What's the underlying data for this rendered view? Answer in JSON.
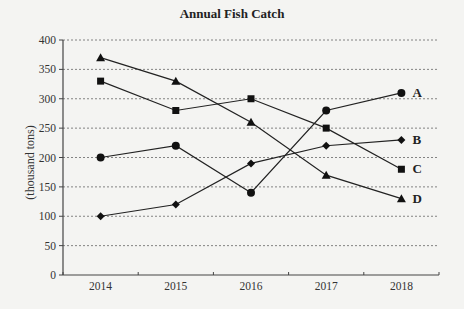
{
  "chart_data": {
    "type": "line",
    "title": "Annual Fish Catch",
    "xlabel": "",
    "ylabel": "(thousand tons)",
    "categories": [
      "2014",
      "2015",
      "2016",
      "2017",
      "2018"
    ],
    "ylim": [
      0,
      400
    ],
    "yticks": [
      0,
      50,
      100,
      150,
      200,
      250,
      300,
      350,
      400
    ],
    "grid": "horizontal dotted",
    "legend": "direct labels at right end of each line",
    "series": [
      {
        "name": "A",
        "marker": "circle",
        "values": [
          200,
          220,
          140,
          280,
          310
        ]
      },
      {
        "name": "B",
        "marker": "diamond",
        "values": [
          100,
          120,
          190,
          220,
          230
        ]
      },
      {
        "name": "C",
        "marker": "square",
        "values": [
          330,
          280,
          300,
          250,
          180
        ]
      },
      {
        "name": "D",
        "marker": "triangle",
        "values": [
          370,
          330,
          260,
          170,
          130
        ]
      }
    ]
  }
}
